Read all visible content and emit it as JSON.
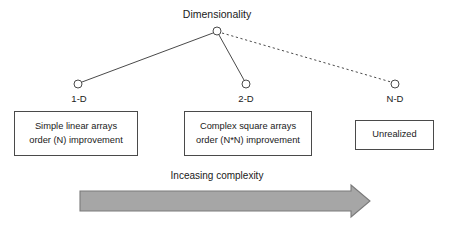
{
  "diagram": {
    "title": "Dimensionality",
    "caption": "Inceasing complexity",
    "colors": {
      "line": "#4a4a4a",
      "text": "#1a1a1a",
      "arrow_fill": "#a6a6a6",
      "arrow_stroke": "#7a7a7a",
      "box_border": "#4a4a4a",
      "background": "#ffffff"
    },
    "root": {
      "label": "Dimensionality",
      "node_name": "root-node",
      "x": 217,
      "y": 31
    },
    "branches": [
      {
        "id": "1d",
        "label": "1-D",
        "node_x": 78,
        "node_y": 84,
        "edge_style": "solid",
        "box_lines": [
          "Simple linear arrays",
          "order (N) improvement"
        ]
      },
      {
        "id": "2d",
        "label": "2-D",
        "node_x": 246,
        "node_y": 84,
        "edge_style": "solid",
        "box_lines": [
          "Complex square arrays",
          "order (N*N) improvement"
        ]
      },
      {
        "id": "nd",
        "label": "N-D",
        "node_x": 395,
        "node_y": 84,
        "edge_style": "dashed",
        "box_lines": [
          "Unrealized"
        ]
      }
    ],
    "arrow": {
      "label": "Inceasing complexity",
      "direction": "right",
      "x_start": 80,
      "x_end": 370,
      "y_center": 201
    }
  }
}
